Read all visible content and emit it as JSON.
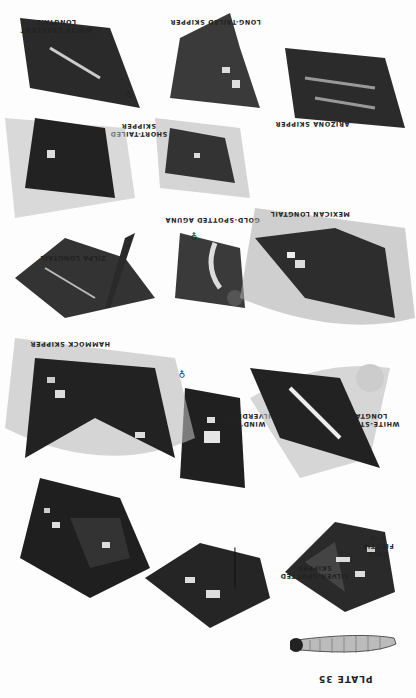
{
  "plate": {
    "number_label": "PLATE 35",
    "orientation": "rotated 180°",
    "species": [
      {
        "id": "dull-firetip",
        "name": "DULL FIRETIP",
        "note": "× ½"
      },
      {
        "id": "silver-spotted-skipper",
        "name": "SILVER-SPOTTED SKIPPER"
      },
      {
        "id": "winds-silverdrop",
        "name": "WIND'S SILVERDROP",
        "sex": "♀"
      },
      {
        "id": "white-striped-longtail",
        "name": "WHITE-STRIPED LONGTAIL"
      },
      {
        "id": "hammock-skipper",
        "name": "HAMMOCK SKIPPER"
      },
      {
        "id": "zilpa-longtail",
        "name": "ZILPA LONGTAIL"
      },
      {
        "id": "gold-spotted-aguna",
        "name": "GOLD-SPOTTED AGUNA",
        "sex": "♀"
      },
      {
        "id": "mexican-longtail",
        "name": "MEXICAN LONGTAIL"
      },
      {
        "id": "short-tailed-skipper",
        "name": "SHORT-TAILED SKIPPER"
      },
      {
        "id": "arizona-skipper",
        "name": "ARIZONA SKIPPER"
      },
      {
        "id": "long-tailed-skipper",
        "name": "LONG-TAILED SKIPPER"
      },
      {
        "id": "white-crescent-longtail",
        "name": "WHITE-CRESCENT LONGTAIL",
        "sex": "♀"
      }
    ],
    "labels": {
      "dull_firetip_1": "DULL",
      "dull_firetip_2": "FIRETIP",
      "dull_firetip_3": "× ½",
      "silver_spotted_1": "SILVER-SPOTTED",
      "silver_spotted_2": "SKIPPER",
      "winds_1": "WIND'S",
      "winds_2": "SILVERDROP",
      "winds_sex": "♀",
      "white_striped_1": "WHITE-STRIPED",
      "white_striped_2": "LONGTAIL",
      "hammock": "HAMMOCK SKIPPER",
      "zilpa": "ZILPA LONGTAIL",
      "gold_spotted": "GOLD-SPOTTED AGUNA",
      "gold_sex": "♀",
      "mexican": "MEXICAN LONGTAIL",
      "short_tailed_1": "SHORT-TAILED",
      "short_tailed_2": "SKIPPER",
      "arizona": "ARIZONA SKIPPER",
      "long_tailed": "LONG-TAILED SKIPPER",
      "white_crescent_1": "WHITE-CRESCENT",
      "white_crescent_2": "LONGTAIL",
      "white_crescent_sex": "♀"
    }
  }
}
